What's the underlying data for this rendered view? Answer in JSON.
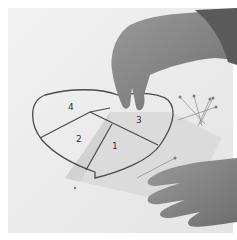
{
  "image": {
    "description": "Black and white photo of hands placing paper over a heart-shaped foundation paper piecing pattern with numbered sections and pins",
    "palette": {
      "background": "#ffffff",
      "paper": "#ececec",
      "overlay_paper": "#d9d9d9",
      "line": "#4a4a4a",
      "skin": "#8a8a8a",
      "skin_dark": "#5a5a5a"
    }
  },
  "pattern": {
    "shape": "heart",
    "sections": [
      {
        "label": "4",
        "x": 68,
        "y": 108
      },
      {
        "label": "2",
        "x": 78,
        "y": 141
      },
      {
        "label": "1",
        "x": 112,
        "y": 147
      },
      {
        "label": "3",
        "x": 137,
        "y": 120
      }
    ]
  }
}
